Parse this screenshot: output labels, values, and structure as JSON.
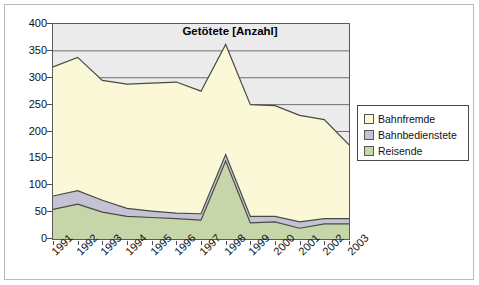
{
  "chart_data": {
    "type": "area",
    "stacked": true,
    "title": "Getötete [Anzahl]",
    "xlabel": "",
    "ylabel": "",
    "ylim": [
      0,
      400
    ],
    "ytick_step": 50,
    "yticks": [
      "0",
      "50",
      "100",
      "150",
      "200",
      "250",
      "300",
      "350",
      "400"
    ],
    "grid": true,
    "grid_axis": "y",
    "legend_position": "right",
    "categories": [
      "1991",
      "1992",
      "1993",
      "1994",
      "1995",
      "1996",
      "1997",
      "1998",
      "1999",
      "2000",
      "2001",
      "2002",
      "2003"
    ],
    "series": [
      {
        "name": "Reisende",
        "color": "#c6d6a8",
        "values": [
          55,
          65,
          50,
          42,
          40,
          38,
          35,
          145,
          30,
          32,
          20,
          28,
          28
        ]
      },
      {
        "name": "Bahnbedienstete",
        "color": "#c3c3d4",
        "values": [
          25,
          25,
          22,
          15,
          12,
          10,
          12,
          12,
          12,
          10,
          12,
          10,
          10
        ]
      },
      {
        "name": "Bahnfremde",
        "color": "#fbf8d8",
        "values": [
          240,
          248,
          223,
          231,
          238,
          244,
          228,
          205,
          208,
          206,
          198,
          184,
          137
        ]
      }
    ],
    "totals": [
      320,
      338,
      295,
      288,
      290,
      292,
      275,
      362,
      250,
      248,
      230,
      222,
      175
    ],
    "plot_background": "#ebebeb",
    "line_color": "#4a4a42"
  },
  "legend": {
    "items": [
      {
        "label": "Bahnfremde",
        "color": "#fbf8d8"
      },
      {
        "label": "Bahnbedienstete",
        "color": "#c3c3d4"
      },
      {
        "label": "Reisende",
        "color": "#c6d6a8"
      }
    ]
  }
}
